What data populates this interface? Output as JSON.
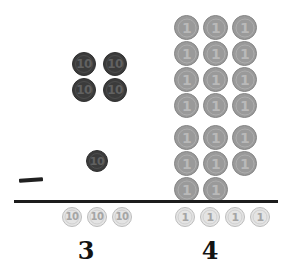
{
  "worksheet": {
    "title": "Coin place-value counting worksheet",
    "background_color": "#ffffff",
    "divider_color": "#1c1c1c",
    "ink_color": "#131313",
    "coin_colors": {
      "dark": "#3b3b3b",
      "mid": "#9a9a9a",
      "pale": "#e4e4e4"
    }
  },
  "marks": {
    "tally_dash": {
      "name": "tally-dash",
      "label": "—"
    }
  },
  "groups": {
    "tens_group": {
      "name": "tens-coin-group",
      "denomination": "10",
      "count": 5,
      "coins": [
        {
          "value": "10",
          "x": 72,
          "y": 52,
          "size": 24
        },
        {
          "value": "10",
          "x": 103,
          "y": 52,
          "size": 24
        },
        {
          "value": "10",
          "x": 72,
          "y": 78,
          "size": 24
        },
        {
          "value": "10",
          "x": 103,
          "y": 78,
          "size": 24
        },
        {
          "value": "10",
          "x": 86,
          "y": 150,
          "size": 22
        }
      ]
    },
    "ones_group_upper": {
      "name": "ones-coin-group-upper",
      "denomination": "1",
      "count": 12,
      "coins": [
        {
          "value": "1",
          "x": 174,
          "y": 15,
          "size": 25
        },
        {
          "value": "1",
          "x": 203,
          "y": 15,
          "size": 25
        },
        {
          "value": "1",
          "x": 232,
          "y": 15,
          "size": 25
        },
        {
          "value": "1",
          "x": 174,
          "y": 41,
          "size": 25
        },
        {
          "value": "1",
          "x": 203,
          "y": 41,
          "size": 25
        },
        {
          "value": "1",
          "x": 232,
          "y": 41,
          "size": 25
        },
        {
          "value": "1",
          "x": 174,
          "y": 67,
          "size": 25
        },
        {
          "value": "1",
          "x": 203,
          "y": 67,
          "size": 25
        },
        {
          "value": "1",
          "x": 232,
          "y": 67,
          "size": 25
        },
        {
          "value": "1",
          "x": 174,
          "y": 93,
          "size": 25
        },
        {
          "value": "1",
          "x": 203,
          "y": 93,
          "size": 25
        },
        {
          "value": "1",
          "x": 232,
          "y": 93,
          "size": 25
        }
      ]
    },
    "ones_group_lower": {
      "name": "ones-coin-group-lower",
      "denomination": "1",
      "count": 8,
      "coins": [
        {
          "value": "1",
          "x": 174,
          "y": 125,
          "size": 25
        },
        {
          "value": "1",
          "x": 203,
          "y": 125,
          "size": 25
        },
        {
          "value": "1",
          "x": 232,
          "y": 125,
          "size": 25
        },
        {
          "value": "1",
          "x": 174,
          "y": 151,
          "size": 25
        },
        {
          "value": "1",
          "x": 203,
          "y": 151,
          "size": 25
        },
        {
          "value": "1",
          "x": 232,
          "y": 151,
          "size": 25
        },
        {
          "value": "1",
          "x": 174,
          "y": 177,
          "size": 25
        },
        {
          "value": "1",
          "x": 203,
          "y": 177,
          "size": 25
        }
      ]
    }
  },
  "answer_row": {
    "left": {
      "name": "answer-tens",
      "denomination": "10",
      "count": 3,
      "number_label": "3",
      "coins": [
        {
          "value": "10",
          "x": 62,
          "y": 207,
          "size": 20
        },
        {
          "value": "10",
          "x": 87,
          "y": 207,
          "size": 20
        },
        {
          "value": "10",
          "x": 112,
          "y": 207,
          "size": 20
        }
      ],
      "number_x": 86,
      "number_y": 239
    },
    "right": {
      "name": "answer-ones",
      "denomination": "1",
      "count": 4,
      "number_label": "4",
      "coins": [
        {
          "value": "1",
          "x": 175,
          "y": 207,
          "size": 20
        },
        {
          "value": "1",
          "x": 200,
          "y": 207,
          "size": 20
        },
        {
          "value": "1",
          "x": 225,
          "y": 207,
          "size": 20
        },
        {
          "value": "1",
          "x": 250,
          "y": 207,
          "size": 20
        }
      ],
      "number_x": 210,
      "number_y": 239
    }
  }
}
